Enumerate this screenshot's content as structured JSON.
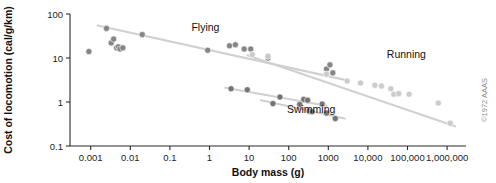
{
  "figure": {
    "credit": "©1972 AAAS"
  },
  "chart_data": {
    "type": "scatter",
    "title": "",
    "xlabel": "Body mass (g)",
    "ylabel": "Cost of locomotion (cal/g/km)",
    "xscale": "log",
    "yscale": "log",
    "xlim": [
      0.0003,
      3000000
    ],
    "ylim": [
      0.1,
      100
    ],
    "grid": false,
    "legend_position": "inline-annotations",
    "xticks": [
      0.001,
      0.01,
      0.1,
      1,
      10,
      100,
      1000,
      10000,
      100000,
      1000000
    ],
    "xtick_labels": [
      "0.001",
      "0.01",
      "0.1",
      "1",
      "10",
      "100",
      "1000",
      "10,000",
      "100,000",
      "1,000,000"
    ],
    "yticks": [
      0.1,
      1,
      10,
      100
    ],
    "ytick_labels": [
      "0.1",
      "1",
      "10",
      "100"
    ],
    "marker_color": "#7f7f7f",
    "marker_color_light": "#c9c9c9",
    "trendline_color": "#d0d0d0",
    "annotations": [
      {
        "text": "Flying",
        "x": 0.35,
        "y": 42
      },
      {
        "text": "Running",
        "x": 30000,
        "y": 10
      },
      {
        "text": "Swimming",
        "x": 90,
        "y": 0.55
      }
    ],
    "series": [
      {
        "name": "Flying",
        "marker_color": "#7f7f7f",
        "trendline": {
          "x": [
            0.0015,
            3000
          ],
          "y": [
            55,
            3.1
          ]
        },
        "points": [
          {
            "x": 0.0009,
            "y": 14
          },
          {
            "x": 0.0025,
            "y": 47
          },
          {
            "x": 0.0033,
            "y": 22
          },
          {
            "x": 0.0038,
            "y": 27
          },
          {
            "x": 0.0045,
            "y": 17
          },
          {
            "x": 0.005,
            "y": 18
          },
          {
            "x": 0.0055,
            "y": 16
          },
          {
            "x": 0.0065,
            "y": 17
          },
          {
            "x": 0.02,
            "y": 34
          },
          {
            "x": 0.9,
            "y": 15
          },
          {
            "x": 3.2,
            "y": 19
          },
          {
            "x": 4.5,
            "y": 20
          },
          {
            "x": 7.5,
            "y": 16
          },
          {
            "x": 11,
            "y": 16
          },
          {
            "x": 30,
            "y": 10
          },
          {
            "x": 900,
            "y": 5.6
          },
          {
            "x": 1100,
            "y": 7
          },
          {
            "x": 1300,
            "y": 4.6
          }
        ]
      },
      {
        "name": "Swimming",
        "marker_color": "#6e6e6e",
        "trendline": {
          "x": [
            2.5,
            900
          ],
          "y": [
            2.1,
            0.82
          ]
        },
        "points": [
          {
            "x": 3.5,
            "y": 2.0
          },
          {
            "x": 9,
            "y": 1.9
          },
          {
            "x": 60,
            "y": 1.3
          },
          {
            "x": 240,
            "y": 1.15
          },
          {
            "x": 300,
            "y": 1.1
          },
          {
            "x": 700,
            "y": 0.9
          }
        ]
      },
      {
        "name": "Swimming-lower",
        "marker_color": "#6e6e6e",
        "trendline": {
          "x": [
            20,
            2600
          ],
          "y": [
            1.1,
            0.42
          ]
        },
        "points": [
          {
            "x": 40,
            "y": 0.92
          },
          {
            "x": 190,
            "y": 0.88
          },
          {
            "x": 330,
            "y": 0.62
          },
          {
            "x": 390,
            "y": 0.6
          },
          {
            "x": 900,
            "y": 0.56
          },
          {
            "x": 1500,
            "y": 0.42
          }
        ]
      },
      {
        "name": "Running",
        "marker_color": "#c9c9c9",
        "trendline": {
          "x": [
            9,
            1600000
          ],
          "y": [
            11.5,
            0.28
          ]
        },
        "points": [
          {
            "x": 12,
            "y": 12
          },
          {
            "x": 30,
            "y": 11
          },
          {
            "x": 900,
            "y": 4.3
          },
          {
            "x": 3000,
            "y": 3.0
          },
          {
            "x": 6500,
            "y": 2.7
          },
          {
            "x": 15000,
            "y": 2.4
          },
          {
            "x": 22000,
            "y": 2.3
          },
          {
            "x": 38000,
            "y": 2.0
          },
          {
            "x": 45000,
            "y": 1.5
          },
          {
            "x": 60000,
            "y": 1.55
          },
          {
            "x": 110000,
            "y": 1.5
          },
          {
            "x": 600000,
            "y": 0.95
          },
          {
            "x": 1200000,
            "y": 0.33
          }
        ]
      }
    ]
  }
}
